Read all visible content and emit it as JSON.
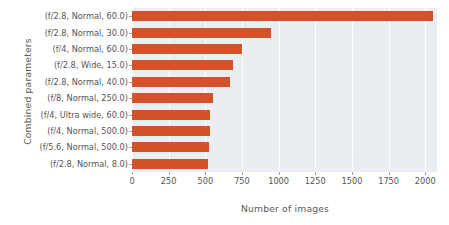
{
  "chart_data": {
    "type": "bar",
    "orientation": "horizontal",
    "title": "",
    "xlabel": "Number of images",
    "ylabel": "Combined parameters",
    "categories": [
      "(f/2.8, Normal, 60.0)",
      "(f/2.8, Normal, 30.0)",
      "(f/4, Normal, 60.0)",
      "(f/2.8, Wide, 15.0)",
      "(f/2.8, Normal, 40.0)",
      "(f/8, Normal, 250.0)",
      "(f/4, Ultra wide, 60.0)",
      "(f/4, Normal, 500.0)",
      "(f/5.6, Normal, 500.0)",
      "(f/2.8, Normal, 8.0)"
    ],
    "values": [
      2050,
      945,
      750,
      690,
      670,
      553,
      532,
      532,
      525,
      515
    ],
    "xticks": [
      0,
      250,
      500,
      750,
      1000,
      1250,
      1500,
      1750,
      2000
    ],
    "xtick_labels": [
      "0",
      "250",
      "500",
      "750",
      "1000",
      "1250",
      "1500",
      "1750",
      "2000"
    ],
    "xlim": [
      0,
      2080
    ],
    "grid": true,
    "legend": "none",
    "bar_color": "#d4522a",
    "plot_background": "#eaeef2",
    "gridline_color": "#ffffff"
  }
}
